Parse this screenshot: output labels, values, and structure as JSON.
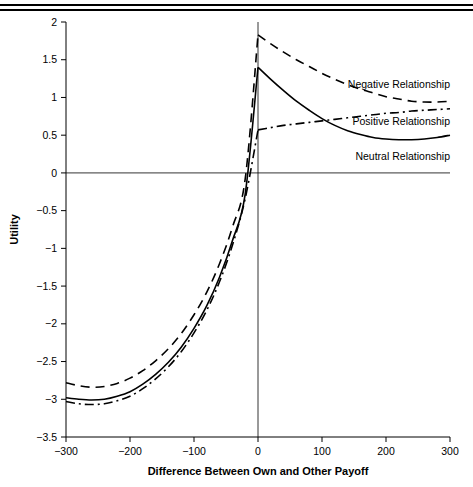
{
  "figure": {
    "top_rules": 2
  },
  "chart_data": {
    "type": "line",
    "title": "",
    "xlabel": "Difference Between Own and Other Payoff",
    "ylabel": "Utility",
    "xlim": [
      -300,
      300
    ],
    "ylim": [
      -3.5,
      2
    ],
    "xticks": [
      -300,
      -200,
      -100,
      0,
      100,
      200,
      300
    ],
    "xtick_labels": [
      "−300",
      "−200",
      "−100",
      "0",
      "100",
      "200",
      "300"
    ],
    "yticks": [
      -3.5,
      -3,
      -2.5,
      -2,
      -1.5,
      -1,
      -0.5,
      0,
      0.5,
      1,
      1.5,
      2
    ],
    "ytick_labels": [
      "−3.5",
      "−3",
      "−2.5",
      "−2",
      "−1.5",
      "−1",
      "−0.5",
      "0",
      "0.5",
      "1",
      "1.5",
      "2"
    ],
    "grid": false,
    "legend_position": "inline-annotations",
    "zero_reference_line_y": 0,
    "vertical_reference_line_x": 0,
    "series": [
      {
        "name": "Negative Relationship",
        "style": "dashed",
        "color": "#000000",
        "label_x": 300,
        "label_y": 1.12,
        "x": [
          -300,
          -280,
          -260,
          -240,
          -220,
          -200,
          -180,
          -160,
          -140,
          -120,
          -100,
          -80,
          -60,
          -40,
          -20,
          0,
          20,
          40,
          60,
          80,
          100,
          120,
          140,
          160,
          180,
          200,
          220,
          240,
          260,
          280,
          300
        ],
        "y": [
          -2.78,
          -2.82,
          -2.84,
          -2.83,
          -2.79,
          -2.72,
          -2.62,
          -2.49,
          -2.33,
          -2.13,
          -1.88,
          -1.58,
          -1.2,
          -0.72,
          -0.08,
          1.83,
          1.71,
          1.6,
          1.5,
          1.41,
          1.32,
          1.24,
          1.17,
          1.11,
          1.06,
          1.01,
          0.98,
          0.95,
          0.94,
          0.94,
          0.95
        ]
      },
      {
        "name": "Neutral Relationship",
        "style": "solid",
        "color": "#000000",
        "label_x": 300,
        "label_y": 0.17,
        "x": [
          -300,
          -280,
          -260,
          -240,
          -220,
          -200,
          -180,
          -160,
          -140,
          -120,
          -100,
          -80,
          -60,
          -40,
          -20,
          0,
          20,
          40,
          60,
          80,
          100,
          120,
          140,
          160,
          180,
          200,
          220,
          240,
          260,
          280,
          300
        ],
        "y": [
          -2.98,
          -3.0,
          -3.01,
          -3.0,
          -2.96,
          -2.9,
          -2.8,
          -2.67,
          -2.51,
          -2.31,
          -2.06,
          -1.76,
          -1.38,
          -0.9,
          -0.28,
          1.4,
          1.24,
          1.09,
          0.95,
          0.83,
          0.72,
          0.63,
          0.56,
          0.51,
          0.47,
          0.45,
          0.44,
          0.44,
          0.45,
          0.47,
          0.5
        ]
      },
      {
        "name": "Positive Relationship",
        "style": "dash-dot",
        "color": "#000000",
        "label_x": 300,
        "label_y": 0.63,
        "x": [
          -300,
          -280,
          -260,
          -240,
          -220,
          -200,
          -180,
          -160,
          -140,
          -120,
          -100,
          -80,
          -60,
          -40,
          -20,
          0,
          20,
          40,
          60,
          80,
          100,
          120,
          140,
          160,
          180,
          200,
          220,
          240,
          260,
          280,
          300
        ],
        "y": [
          -3.03,
          -3.06,
          -3.07,
          -3.06,
          -3.02,
          -2.96,
          -2.86,
          -2.73,
          -2.57,
          -2.37,
          -2.12,
          -1.82,
          -1.44,
          -0.96,
          -0.34,
          0.57,
          0.6,
          0.63,
          0.65,
          0.67,
          0.69,
          0.71,
          0.73,
          0.75,
          0.77,
          0.79,
          0.8,
          0.82,
          0.83,
          0.84,
          0.85
        ]
      }
    ]
  }
}
